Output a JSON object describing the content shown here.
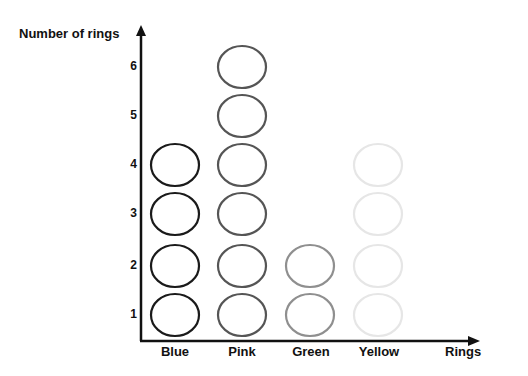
{
  "chart_data": {
    "type": "pictograph",
    "title": "",
    "xlabel": "Rings",
    "ylabel": "Number of rings",
    "categories": [
      "Blue",
      "Pink",
      "Green",
      "Yellow"
    ],
    "values": [
      4,
      6,
      2,
      4
    ],
    "yticks": [
      "1",
      "2",
      "3",
      "4",
      "5",
      "6"
    ],
    "ylim": [
      0,
      6
    ],
    "grid": false,
    "legend": "none",
    "ring_colors": [
      "#1a1a1a",
      "#555555",
      "#8f8f8f",
      "#e6e6e6"
    ]
  },
  "labels": {
    "ylabel": "Number of rings",
    "xlabel": "Rings",
    "categories": [
      "Blue",
      "Pink",
      "Green",
      "Yellow"
    ],
    "yticks": [
      "1",
      "2",
      "3",
      "4",
      "5",
      "6"
    ]
  }
}
